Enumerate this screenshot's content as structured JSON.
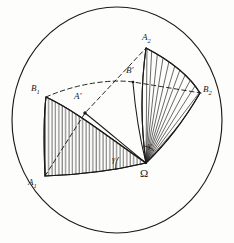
{
  "figure": {
    "colors": {
      "ink": "#1a1a1a",
      "paper": "#fdfdfc",
      "hatch": "#2a2a2a"
    },
    "sphere": {
      "name": "sphere-outline",
      "center_x": 117,
      "center_y": 120,
      "radius_x": 105,
      "radius_y": 113
    },
    "vertices": [
      {
        "id": "A1",
        "label": "A",
        "subscript": "1",
        "x": 45,
        "y": 176
      },
      {
        "id": "A2",
        "label": "A",
        "subscript": "2",
        "x": 146,
        "y": 48
      },
      {
        "id": "B1",
        "label": "B",
        "subscript": "1",
        "x": 46,
        "y": 97
      },
      {
        "id": "B2",
        "label": "B",
        "subscript": "2",
        "x": 200,
        "y": 93
      },
      {
        "id": "Aprime",
        "label": "A'",
        "subscript": "",
        "x": 85,
        "y": 112
      },
      {
        "id": "Bprime",
        "label": "B'",
        "subscript": "",
        "x": 133,
        "y": 82
      },
      {
        "id": "Omega",
        "label": "Ω",
        "subscript": "",
        "x": 146,
        "y": 163
      }
    ],
    "labels": [
      {
        "name": "vertex-label-A1",
        "text": "A",
        "sub": "1",
        "x": 28,
        "y": 178,
        "kind": "point"
      },
      {
        "name": "vertex-label-A2",
        "text": "A",
        "sub": "2",
        "x": 142,
        "y": 33,
        "kind": "point"
      },
      {
        "name": "vertex-label-B1",
        "text": "B",
        "sub": "1",
        "x": 31,
        "y": 84,
        "kind": "point"
      },
      {
        "name": "vertex-label-B2",
        "text": "B",
        "sub": "2",
        "x": 203,
        "y": 85,
        "kind": "point"
      },
      {
        "name": "vertex-label-A-prime",
        "text": "A'",
        "sub": "",
        "x": 74,
        "y": 92,
        "kind": "point"
      },
      {
        "name": "vertex-label-B-prime",
        "text": "B'",
        "sub": "",
        "x": 126,
        "y": 66,
        "kind": "point"
      },
      {
        "name": "vertex-label-omega",
        "text": "Ω",
        "sub": "",
        "x": 140,
        "y": 170,
        "kind": "origin"
      },
      {
        "name": "angle-label-gamma-left",
        "text": "γ",
        "sub": "",
        "x": 113,
        "y": 157,
        "kind": "angle"
      },
      {
        "name": "angle-label-gamma-right",
        "text": "γ",
        "sub": "",
        "x": 148,
        "y": 143,
        "kind": "angle"
      }
    ],
    "regions": [
      {
        "name": "hatched-region-left",
        "hatch_direction": "vertical",
        "between": [
          "A1",
          "B1",
          "Omega"
        ]
      },
      {
        "name": "hatched-region-right",
        "hatch_direction": "radial",
        "between": [
          "A2",
          "B2",
          "Omega"
        ]
      }
    ],
    "solid_edges": [
      {
        "name": "edge-omega-A1",
        "from": "Omega",
        "to": "A1"
      },
      {
        "name": "edge-omega-B1",
        "from": "Omega",
        "to": "B1"
      },
      {
        "name": "edge-omega-Aprime",
        "from": "Omega",
        "to": "Aprime"
      },
      {
        "name": "edge-omega-Bprime",
        "from": "Omega",
        "to": "Bprime"
      },
      {
        "name": "edge-omega-A2",
        "from": "Omega",
        "to": "A2"
      },
      {
        "name": "edge-omega-B2",
        "from": "Omega",
        "to": "B2"
      },
      {
        "name": "arc-A1-B1",
        "from": "A1",
        "to": "B1"
      },
      {
        "name": "arc-A2-B2",
        "from": "A2",
        "to": "B2"
      }
    ],
    "dashed_edges": [
      {
        "name": "dashed-arc-B1-Bprime-B2",
        "from": "B1",
        "to": "B2",
        "through": "Bprime"
      },
      {
        "name": "dashed-line-A1-Aprime-A2",
        "from": "A1",
        "to": "A2",
        "through": "Aprime"
      }
    ]
  }
}
